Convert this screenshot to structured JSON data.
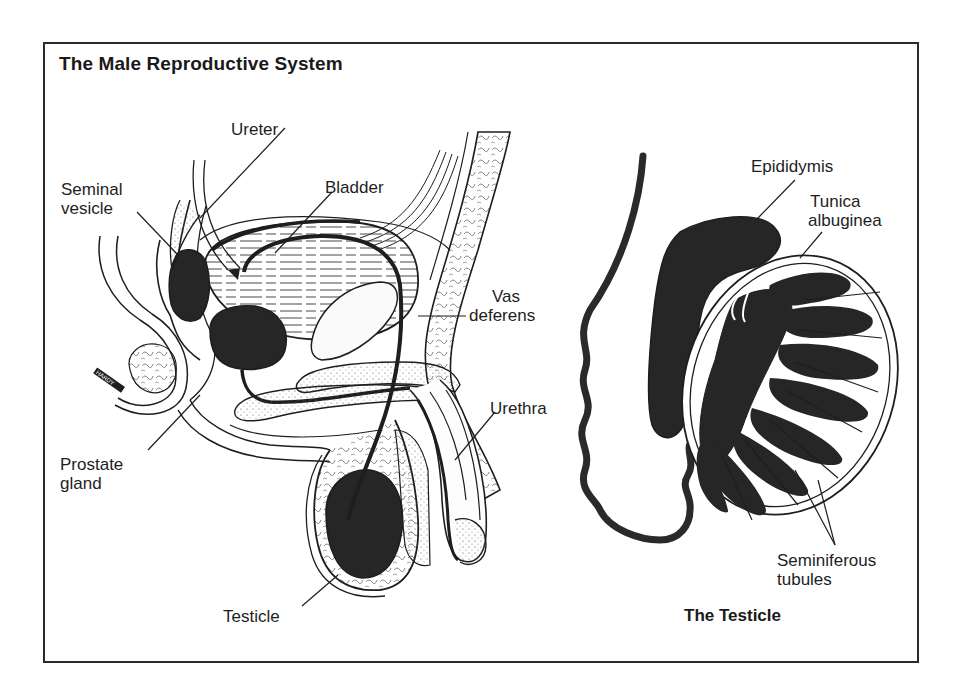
{
  "title": "The Male Reproductive System",
  "left_figure": {
    "name": "Sagittal section of male pelvis",
    "labels": {
      "ureter": "Ureter",
      "seminal_vesicle_1": "Seminal",
      "seminal_vesicle_2": "vesicle",
      "bladder": "Bladder",
      "vas_deferens_1": "Vas",
      "vas_deferens_2": "deferens",
      "urethra": "Urethra",
      "prostate_1": "Prostate",
      "prostate_2": "gland",
      "testicle": "Testicle"
    },
    "signature": "HARDY"
  },
  "right_figure": {
    "caption": "The Testicle",
    "labels": {
      "epididymis": "Epididymis",
      "tunica_1": "Tunica",
      "tunica_2": "albuginea",
      "seminiferous_1": "Seminiferous",
      "seminiferous_2": "tubules"
    }
  },
  "colors": {
    "ink": "#1e1e1e",
    "fill_dark": "#262626",
    "paper": "#ffffff"
  }
}
